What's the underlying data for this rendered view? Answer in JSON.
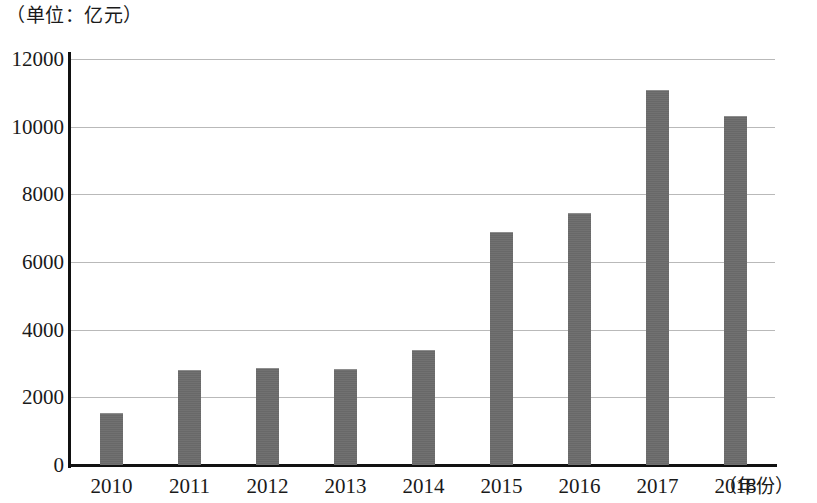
{
  "chart_data": {
    "type": "bar",
    "title": "（单位：亿元）",
    "subtitle": "",
    "xlabel": "（年份）",
    "ylabel": "",
    "categories": [
      "2010",
      "2011",
      "2012",
      "2013",
      "2014",
      "2015",
      "2016",
      "2017",
      "2018"
    ],
    "values": [
      1550,
      2820,
      2880,
      2840,
      3400,
      6880,
      7450,
      11070,
      10330
    ],
    "ylim": [
      0,
      12000
    ],
    "yticks": [
      0,
      2000,
      4000,
      6000,
      8000,
      10000,
      12000
    ],
    "ytick_labels": [
      "0",
      "2000",
      "4000",
      "6000",
      "8000",
      "10000",
      "12000"
    ],
    "grid": true,
    "legend": null,
    "legend_position": "none",
    "bar_color": "#6b6b6b",
    "axis_color": "#111111",
    "grid_color": "#b9b9b9",
    "background_color": "#ffffff"
  }
}
